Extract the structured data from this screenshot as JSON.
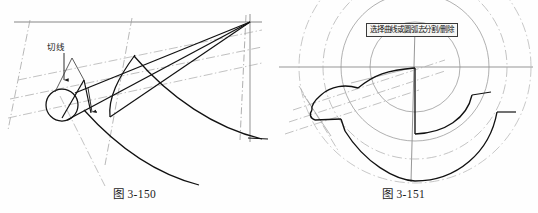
{
  "page": {
    "background_color": "#fefefe",
    "ink_color": "#1a1a1a",
    "construction_color": "#9a9a9a"
  },
  "figures": [
    {
      "id": "fig-3-150",
      "caption": "图 3-150",
      "annotation_label": "切线",
      "description": "tangent-line construction with circle, tangent lines, cone outline and two concentric arcs"
    },
    {
      "id": "fig-3-151",
      "caption": "图 3-151",
      "prompt_text": "选择曲线或圆弧去分割/删除",
      "description": "C shaped claw profile with concentric construction circles and centre lines"
    }
  ],
  "left_figure": {
    "caption": "图 3-150",
    "tangent_label": "切线"
  },
  "right_figure": {
    "caption": "图 3-151",
    "prompt": "选择曲线或圆弧去分割/删除"
  }
}
